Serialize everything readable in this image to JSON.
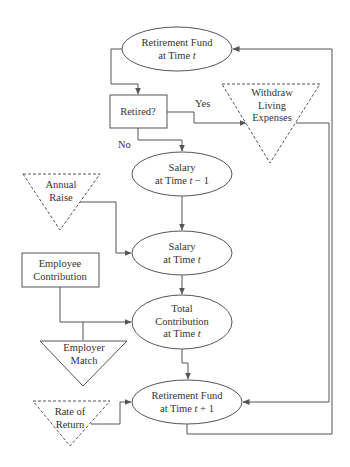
{
  "diagram": {
    "nodes": {
      "fund_t": {
        "shape": "ellipse",
        "line1": "Retirement Fund",
        "line2_prefix": "at Time ",
        "line2_var": "t",
        "line2_suffix": ""
      },
      "retired": {
        "shape": "rectangle",
        "label": "Retired?"
      },
      "withdraw": {
        "shape": "dashed-inverted-triangle",
        "line1": "Withdraw",
        "line2": "Living",
        "line3": "Expenses"
      },
      "salary_prev": {
        "shape": "ellipse",
        "line1": "Salary",
        "line2_prefix": "at Time ",
        "line2_var": "t",
        "line2_suffix": " − 1"
      },
      "annual_raise": {
        "shape": "dashed-inverted-triangle",
        "line1": "Annual",
        "line2": "Raise"
      },
      "salary_t": {
        "shape": "ellipse",
        "line1": "Salary",
        "line2_prefix": "at Time ",
        "line2_var": "t",
        "line2_suffix": ""
      },
      "employee_contribution": {
        "shape": "rectangle",
        "line1": "Employee",
        "line2": "Contribution"
      },
      "total_contribution": {
        "shape": "ellipse",
        "line1": "Total",
        "line2": "Contribution",
        "line3_prefix": "at Time ",
        "line3_var": "t"
      },
      "employer_match": {
        "shape": "inverted-triangle",
        "line1": "Employer",
        "line2": "Match"
      },
      "fund_t1": {
        "shape": "ellipse",
        "line1": "Retirement Fund",
        "line2_prefix": "at Time ",
        "line2_var": "t",
        "line2_suffix": " + 1"
      },
      "rate_of_return": {
        "shape": "dashed-inverted-triangle",
        "line1": "Rate of",
        "line2": "Return"
      }
    },
    "edge_labels": {
      "yes": "Yes",
      "no": "No"
    },
    "edges": [
      {
        "from": "fund_t",
        "to": "retired"
      },
      {
        "from": "retired",
        "to": "withdraw",
        "label": "Yes"
      },
      {
        "from": "retired",
        "to": "salary_prev",
        "label": "No"
      },
      {
        "from": "withdraw",
        "to": "fund_t1"
      },
      {
        "from": "salary_prev",
        "to": "salary_t"
      },
      {
        "from": "annual_raise",
        "to": "salary_t"
      },
      {
        "from": "salary_t",
        "to": "total_contribution"
      },
      {
        "from": "employee_contribution",
        "to": "total_contribution"
      },
      {
        "from": "employer_match",
        "to": "total_contribution"
      },
      {
        "from": "total_contribution",
        "to": "fund_t1"
      },
      {
        "from": "rate_of_return",
        "to": "fund_t1"
      },
      {
        "from": "fund_t1",
        "to": "fund_t"
      }
    ],
    "colors": {
      "stroke": "#555555",
      "text": "#333333",
      "background": "#ffffff"
    }
  }
}
